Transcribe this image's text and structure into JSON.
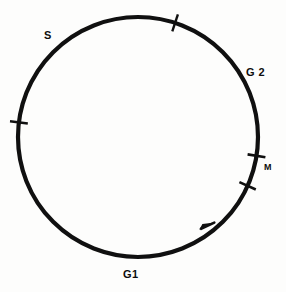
{
  "figure": {
    "background_color": "#fdfdfc",
    "stroke_color": "#101010",
    "width": 286,
    "height": 292
  },
  "cycle": {
    "center_x": 138,
    "center_y": 137,
    "radius": 120,
    "stroke_width": 4.2,
    "direction": "counterclockwise"
  },
  "labels": {
    "s": "S",
    "g2": "G 2",
    "m": "M",
    "g1": "G1"
  },
  "ticks": [
    {
      "name": "s-g2-boundary",
      "angle_deg": -72,
      "length": 18
    },
    {
      "name": "g1-s-boundary",
      "angle_deg": 187,
      "length": 18
    },
    {
      "name": "g2-m-boundary",
      "angle_deg": 9,
      "length": 18
    },
    {
      "name": "m-g1-boundary",
      "angle_deg": 24,
      "length": 18
    }
  ],
  "arrow": {
    "name": "direction-arrowhead",
    "angle_deg": 49,
    "label": "counterclockwise-progression"
  },
  "chart_data": {
    "type": "pie",
    "categories": [
      "G1",
      "S",
      "G2",
      "M"
    ],
    "values": [
      null,
      null,
      null,
      null
    ],
    "xlabel": "",
    "ylabel": "",
    "legend": "none",
    "grid": false
  }
}
